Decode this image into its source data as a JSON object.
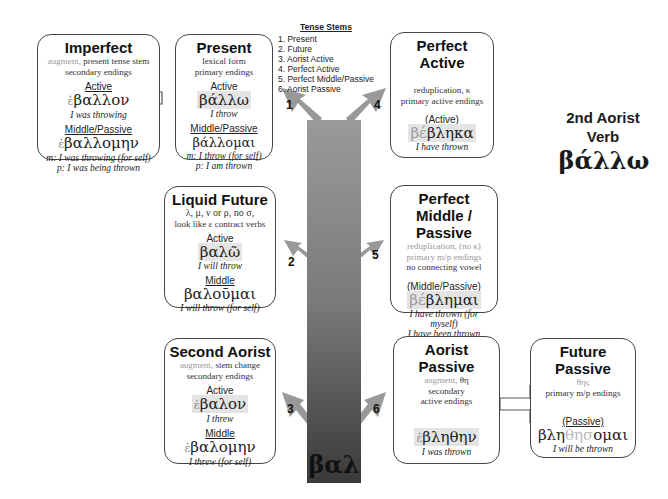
{
  "tense_stems": {
    "heading": "Tense Stems",
    "items": [
      "1.  Present",
      "2.  Future",
      "3.  Aorist Active",
      "4.  Perfect Active",
      "5.  Perfect Middle/Passive",
      "6.  Aorist Passive"
    ]
  },
  "verb": {
    "title_line1": "2nd Aorist",
    "title_line2": "Verb",
    "lexical": "βάλλω"
  },
  "root": "βαλ",
  "arrow_numbers": [
    "1",
    "2",
    "3",
    "4",
    "5",
    "6"
  ],
  "boxes": {
    "imperfect": {
      "title": "Imperfect",
      "desc_aug": "augment,",
      "desc1": " present tense stem",
      "desc2": "secondary endings",
      "active_label": "Active",
      "active_aug": "ἐ",
      "active_form": "βαλλον",
      "active_gloss": "I was throwing",
      "mp_label": "Middle/Passive",
      "mp_aug": "ἐ",
      "mp_form": "βαλλομην",
      "mp_gloss_m": "m: I was throwing (for self)",
      "mp_gloss_p": "p: I was being thrown"
    },
    "present": {
      "title": "Present",
      "desc1": "lexical form",
      "desc2": "primary endings",
      "active_label": "Active",
      "active_form": "βάλλω",
      "active_gloss": "I throw",
      "mp_label": "Middle/Passive",
      "mp_form": "βάλλομαι",
      "mp_gloss_m": "m: I throw (for self)",
      "mp_gloss_p": "p: I am thrown"
    },
    "perfect_active": {
      "title_line1": "Perfect",
      "title_line2": "Active",
      "desc1": "reduplication, κ",
      "desc2": "primary active endings",
      "label": "(Active)",
      "redup": "βέ",
      "form": "βληκα",
      "gloss": "I have thrown"
    },
    "liquid_future": {
      "title": "Liquid Future",
      "desc1": "λ, μ, ν or ρ, no σ,",
      "desc2": "look like ε contract verbs",
      "active_label": "Active",
      "active_form": "βαλῶ",
      "active_gloss": "I will throw",
      "middle_label": "Middle",
      "middle_form": "βαλοῦμαι",
      "middle_gloss": "I will throw (for self)"
    },
    "perfect_mp": {
      "title_line1": "Perfect",
      "title_line2": "Middle / Passive",
      "desc1": "reduplication, (no κ)",
      "desc2": "primary m/p endings",
      "desc3": "no connecting vowel",
      "label": "(Middle/Passive)",
      "redup": "βέ",
      "form": "βλημαι",
      "gloss1": "I have thrown (for myself)",
      "gloss2": "I have been thrown"
    },
    "second_aorist": {
      "title": "Second Aorist",
      "desc_aug": "augment,",
      "desc1": " stem change",
      "desc2": "secondary endings",
      "active_label": "Active",
      "active_aug": "ἐ",
      "active_form": "βαλον",
      "active_gloss": "I threw",
      "middle_label": "Middle",
      "middle_aug": "ἐ",
      "middle_form": "βαλομην",
      "middle_gloss": "I threw (for self)"
    },
    "aorist_passive": {
      "title_line1": "Aorist",
      "title_line2": "Passive",
      "desc_aug": "augment,",
      "desc_suffix": " θη",
      "desc2": "secondary",
      "desc3": "active endings",
      "aug": "ἐ",
      "form": "βληθην",
      "gloss": "I was thrown"
    },
    "future_passive": {
      "title_line1": "Future",
      "title_line2": "Passive",
      "desc1": "θης",
      "desc2": "primary m/p endings",
      "label": "(Passive)",
      "form_a": "βλη",
      "form_b": "θησ",
      "form_c": "ομαι",
      "gloss": "I will be thrown"
    }
  }
}
